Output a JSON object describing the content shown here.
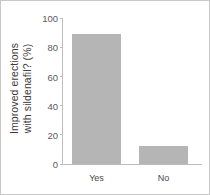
{
  "chart_data": {
    "type": "bar",
    "title": "",
    "xlabel": "",
    "ylabel": "Improved erections with sildenafil? (%)",
    "ylabel_line1": "Improved erections",
    "ylabel_line2": "with sildenafil? (%)",
    "categories": [
      "Yes",
      "No"
    ],
    "values": [
      89,
      12
    ],
    "ylim": [
      0,
      100
    ],
    "yticks": [
      0,
      20,
      40,
      60,
      80,
      100
    ],
    "ytick_labels": [
      "0",
      "20",
      "40",
      "60",
      "80",
      "100"
    ],
    "grid": false,
    "legend": "none",
    "bar_color": "#b4b5b4",
    "axis_color": "#bdbdbd",
    "text_color": "#3a3a3a"
  }
}
